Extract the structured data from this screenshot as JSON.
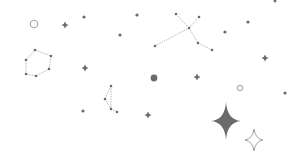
{
  "scene": {
    "background": "#ffffff",
    "colors": {
      "star": "#6b6b6b",
      "line": "#a8a8a8",
      "outline": "#8a8a8a"
    },
    "dots": [
      {
        "x": 84,
        "y": 17,
        "r": 1.6
      },
      {
        "x": 137,
        "y": 15,
        "r": 1.6
      },
      {
        "x": 120,
        "y": 35,
        "r": 1.6
      },
      {
        "x": 225,
        "y": 32,
        "r": 1.6
      },
      {
        "x": 248,
        "y": 22,
        "r": 1.6
      },
      {
        "x": 275,
        "y": 1,
        "r": 1.4
      },
      {
        "x": 83,
        "y": 111,
        "r": 1.6
      },
      {
        "x": 285,
        "y": 93,
        "r": 1.6
      },
      {
        "x": 154,
        "y": 78,
        "r": 3.4
      }
    ],
    "plus_stars": [
      {
        "x": 65,
        "y": 25,
        "s": 3.5
      },
      {
        "x": 85,
        "y": 68,
        "s": 3.5
      },
      {
        "x": 197,
        "y": 77,
        "s": 3.5
      },
      {
        "x": 265,
        "y": 58,
        "s": 3.5
      },
      {
        "x": 148,
        "y": 115,
        "s": 3.5
      }
    ],
    "hollow_circles": [
      {
        "x": 34,
        "y": 24,
        "r": 3.8
      },
      {
        "x": 240,
        "y": 88,
        "r": 2.8
      }
    ],
    "big_star": {
      "x": 226,
      "y": 121,
      "w": 15,
      "h": 19
    },
    "outline_star": {
      "x": 254,
      "y": 140,
      "w": 9,
      "h": 11
    },
    "constellations": [
      {
        "name": "polygon",
        "closed": true,
        "points": [
          [
            35,
            50
          ],
          [
            51,
            56
          ],
          [
            49,
            69
          ],
          [
            36,
            76
          ],
          [
            26,
            74
          ],
          [
            26,
            60
          ]
        ]
      },
      {
        "name": "x-shape",
        "closed": false,
        "segments": [
          [
            [
              176,
              14
            ],
            [
              189,
              28
            ]
          ],
          [
            [
              199,
              17
            ],
            [
              189,
              28
            ]
          ],
          [
            [
              155,
              46
            ],
            [
              189,
              28
            ]
          ],
          [
            [
              189,
              28
            ],
            [
              198,
              43
            ]
          ],
          [
            [
              198,
              43
            ],
            [
              212,
              50
            ]
          ]
        ],
        "points": [
          [
            176,
            14
          ],
          [
            199,
            17
          ],
          [
            189,
            28
          ],
          [
            155,
            46
          ],
          [
            198,
            43
          ],
          [
            212,
            50
          ]
        ]
      },
      {
        "name": "small-kite",
        "closed": false,
        "segments": [
          [
            [
              111,
              86
            ],
            [
              105,
              99
            ]
          ],
          [
            [
              105,
              99
            ],
            [
              111,
              109
            ]
          ],
          [
            [
              111,
              109
            ],
            [
              117,
              112
            ]
          ],
          [
            [
              111,
              86
            ],
            [
              111,
              109
            ]
          ]
        ],
        "points": [
          [
            111,
            86
          ],
          [
            105,
            99
          ],
          [
            111,
            109
          ],
          [
            117,
            112
          ]
        ]
      }
    ]
  }
}
